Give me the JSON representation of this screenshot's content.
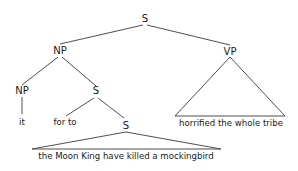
{
  "diagram": {
    "type": "syntax-tree",
    "nodes": {
      "root": {
        "label": "S"
      },
      "subject_np": {
        "label": "NP"
      },
      "predicate_vp": {
        "label": "VP"
      },
      "inner_np": {
        "label": "NP"
      },
      "complement_s": {
        "label": "S"
      },
      "embedded_s": {
        "label": "S"
      }
    },
    "leaves": {
      "it": "it",
      "complementizer": "for to",
      "embedded_clause": "the Moon King have killed a mockingbird",
      "vp_phrase": "horrified the whole tribe"
    },
    "edges": [
      [
        "S",
        "NP"
      ],
      [
        "S",
        "VP"
      ],
      [
        "NP",
        "NP"
      ],
      [
        "NP",
        "S"
      ],
      [
        "NP",
        "it"
      ],
      [
        "S",
        "for to"
      ],
      [
        "S",
        "S"
      ],
      [
        "S",
        "the Moon King have killed a mockingbird (triangle)"
      ],
      [
        "VP",
        "horrified the whole tribe (triangle)"
      ]
    ]
  }
}
